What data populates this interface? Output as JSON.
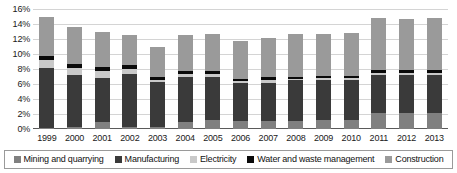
{
  "chart_data": {
    "type": "bar",
    "subtype": "stacked-bar",
    "title": "",
    "xlabel": "",
    "ylabel": "",
    "ylim": [
      0,
      16
    ],
    "ytick_labels": [
      "16%",
      "14%",
      "12%",
      "10%",
      "8%",
      "6%",
      "4%",
      "2%",
      "0%"
    ],
    "ytick_values": [
      16,
      14,
      12,
      10,
      8,
      6,
      4,
      2,
      0
    ],
    "ytick_suffix": "%",
    "grid": true,
    "legend_position": "bottom",
    "categories": [
      "1999",
      "2000",
      "2001",
      "2002",
      "2003",
      "2004",
      "2005",
      "2006",
      "2007",
      "2008",
      "2009",
      "2010",
      "2011",
      "2012",
      "2013"
    ],
    "series": [
      {
        "name": "Mining and quarrying",
        "color": "#808080",
        "values": [
          0.2,
          0.3,
          0.9,
          0.3,
          0.3,
          1.0,
          1.2,
          1.1,
          1.1,
          1.1,
          1.2,
          1.2,
          2.2,
          2.2,
          2.2
        ]
      },
      {
        "name": "Manufacturing",
        "color": "#3a3a3a",
        "values": [
          7.9,
          6.9,
          5.9,
          7.1,
          6.0,
          6.0,
          5.8,
          5.0,
          5.0,
          5.4,
          5.4,
          5.4,
          5.0,
          5.0,
          5.0
        ]
      },
      {
        "name": "Electricity",
        "color": "#c9c9c9",
        "values": [
          1.1,
          1.0,
          1.0,
          0.6,
          0.3,
          0.4,
          0.4,
          0.3,
          0.5,
          0.2,
          0.2,
          0.2,
          0.3,
          0.3,
          0.3
        ]
      },
      {
        "name": "Water and waste management",
        "color": "#0a0a0a",
        "values": [
          0.6,
          0.5,
          0.5,
          0.5,
          0.3,
          0.3,
          0.3,
          0.3,
          0.4,
          0.3,
          0.3,
          0.3,
          0.4,
          0.4,
          0.4
        ]
      },
      {
        "name": "Construction",
        "color": "#9a9a9a",
        "values": [
          5.2,
          4.9,
          4.7,
          4.0,
          4.0,
          4.8,
          5.0,
          5.0,
          5.1,
          5.7,
          5.6,
          5.7,
          6.9,
          6.8,
          6.9
        ]
      }
    ],
    "totals": [
      15.0,
      13.6,
      13.0,
      12.5,
      10.9,
      12.5,
      12.7,
      11.7,
      12.1,
      12.7,
      12.7,
      12.8,
      14.8,
      14.7,
      14.8
    ]
  },
  "legend": {
    "items": [
      {
        "label": "Mining and quarrying",
        "color": "#808080"
      },
      {
        "label": "Manufacturing",
        "color": "#3a3a3a"
      },
      {
        "label": "Electricity",
        "color": "#c9c9c9"
      },
      {
        "label": "Water and waste management",
        "color": "#0a0a0a"
      },
      {
        "label": "Construction",
        "color": "#9a9a9a"
      }
    ]
  }
}
